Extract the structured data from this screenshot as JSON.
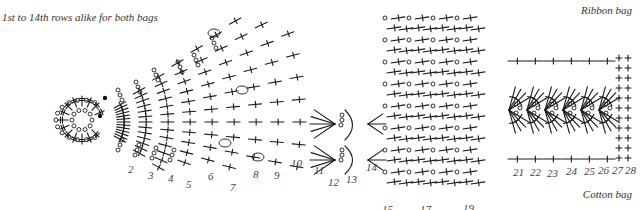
{
  "captions": {
    "top_left": "1st to 14th rows alike for both bags",
    "ribbon_bag": "Ribbon bag",
    "cotton_bag": "Cotton bag"
  },
  "row_labels": [
    {
      "text": "2",
      "x": 128,
      "y": 173
    },
    {
      "text": "3",
      "x": 148,
      "y": 179
    },
    {
      "text": "4",
      "x": 168,
      "y": 182
    },
    {
      "text": "5",
      "x": 186,
      "y": 188
    },
    {
      "text": "6",
      "x": 208,
      "y": 180
    },
    {
      "text": "7",
      "x": 230,
      "y": 191
    },
    {
      "text": "8",
      "x": 253,
      "y": 178
    },
    {
      "text": "9",
      "x": 274,
      "y": 179
    },
    {
      "text": "10",
      "x": 291,
      "y": 167
    },
    {
      "text": "11",
      "x": 314,
      "y": 174
    },
    {
      "text": "12",
      "x": 328,
      "y": 186
    },
    {
      "text": "13",
      "x": 346,
      "y": 183
    },
    {
      "text": "14",
      "x": 366,
      "y": 171
    },
    {
      "text": "15",
      "x": 382,
      "y": 213
    },
    {
      "text": "17",
      "x": 420,
      "y": 213
    },
    {
      "text": "19",
      "x": 463,
      "y": 212
    },
    {
      "text": "21",
      "x": 513,
      "y": 176
    },
    {
      "text": "22",
      "x": 530,
      "y": 176
    },
    {
      "text": "23",
      "x": 547,
      "y": 177
    },
    {
      "text": "24",
      "x": 566,
      "y": 175
    },
    {
      "text": "25",
      "x": 584,
      "y": 175
    },
    {
      "text": "26",
      "x": 598,
      "y": 174
    },
    {
      "text": "27",
      "x": 612,
      "y": 174
    },
    {
      "text": "28",
      "x": 625,
      "y": 174
    }
  ],
  "legend": {
    "symbols": [
      {
        "name": "chain",
        "glyph": "o"
      },
      {
        "name": "single-crochet",
        "glyph": "+"
      },
      {
        "name": "double-crochet",
        "glyph": "†"
      },
      {
        "name": "slip-stitch",
        "glyph": "•"
      }
    ]
  },
  "colors": {
    "ink": "#1a1a1a",
    "label": "#444444",
    "background": "#ffffff"
  }
}
